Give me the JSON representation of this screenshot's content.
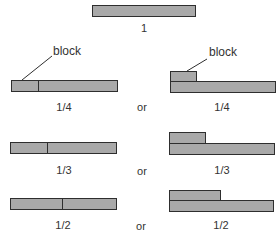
{
  "colors": {
    "fill": "#a9a9a9",
    "stroke": "#2e2e2e",
    "text": "#333333"
  },
  "whole": {
    "label": "1"
  },
  "callouts": {
    "left": "block",
    "right": "block"
  },
  "rows": [
    {
      "fraction": "1/4",
      "connector": "or",
      "left_label": "1/4",
      "right_label": "1/4"
    },
    {
      "fraction": "1/3",
      "connector": "or",
      "left_label": "1/3",
      "right_label": "1/3"
    },
    {
      "fraction": "1/2",
      "connector": "or",
      "left_label": "1/2",
      "right_label": "1/2"
    }
  ]
}
